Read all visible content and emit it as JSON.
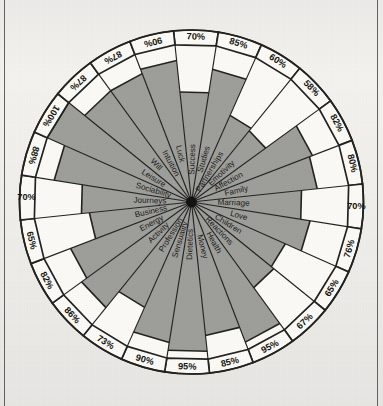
{
  "page": {
    "background_color": "#f3f2ef",
    "ink_color": "#232320",
    "fill_color": "#9e9e9b",
    "empty_color": "#fbfaf7"
  },
  "chart_data": {
    "type": "radar",
    "subtitle": "",
    "xlabel": "",
    "ylabel": "",
    "ylim": [
      0,
      100
    ],
    "grid": false,
    "legend": "none",
    "value_suffix": "%",
    "sector_count": 30,
    "start_angle_deg": -96,
    "categories": [
      "Success",
      "Studies",
      "Partnerships",
      "Emotivity",
      "Affection",
      "Family",
      "Marriage",
      "Love",
      "Children",
      "Reactions",
      "Health",
      "Money",
      "Dietetics",
      "Sensuality",
      "Profession",
      "Activity",
      "Energy",
      "Business",
      "Journeys",
      "Sociability",
      "Leisure",
      "Will",
      "Intuition",
      "Luck"
    ],
    "series": [
      {
        "name": "Score",
        "values": [
          70,
          85,
          60,
          58,
          82,
          80,
          70,
          76,
          65,
          67,
          95,
          85,
          95,
          90,
          73,
          86,
          82,
          65,
          70,
          88,
          100,
          87,
          87,
          90
        ]
      }
    ],
    "sectors": [
      {
        "label": "Success",
        "value": 70,
        "value_text": "70%"
      },
      {
        "label": "Studies",
        "value": 85,
        "value_text": "85%"
      },
      {
        "label": "Partnerships",
        "value": 60,
        "value_text": "60%"
      },
      {
        "label": "Emotivity",
        "value": 58,
        "value_text": "58%"
      },
      {
        "label": "Affection",
        "value": 82,
        "value_text": "82%"
      },
      {
        "label": "Family",
        "value": 80,
        "value_text": "80%"
      },
      {
        "label": "Marriage",
        "value": 70,
        "value_text": "70%"
      },
      {
        "label": "Love",
        "value": 76,
        "value_text": "76%"
      },
      {
        "label": "Children",
        "value": 65,
        "value_text": "65%"
      },
      {
        "label": "Reactions",
        "value": 67,
        "value_text": "67%"
      },
      {
        "label": "Health",
        "value": 95,
        "value_text": "95%"
      },
      {
        "label": "Money",
        "value": 85,
        "value_text": "85%"
      },
      {
        "label": "Dietetics",
        "value": 95,
        "value_text": "95%"
      },
      {
        "label": "Sensuality",
        "value": 90,
        "value_text": "90%"
      },
      {
        "label": "Profession",
        "value": 73,
        "value_text": "73%"
      },
      {
        "label": "Activity",
        "value": 86,
        "value_text": "86%"
      },
      {
        "label": "Energy",
        "value": 82,
        "value_text": "82%"
      },
      {
        "label": "Business",
        "value": 65,
        "value_text": "65%"
      },
      {
        "label": "Journeys",
        "value": 70,
        "value_text": "70%"
      },
      {
        "label": "Sociability",
        "value": 88,
        "value_text": "88%"
      },
      {
        "label": "Leisure",
        "value": 100,
        "value_text": "100%"
      },
      {
        "label": "Will",
        "value": 87,
        "value_text": "87%"
      },
      {
        "label": "Intuition",
        "value": 87,
        "value_text": "87%"
      },
      {
        "label": "Luck",
        "value": 90,
        "value_text": "90%"
      }
    ]
  }
}
